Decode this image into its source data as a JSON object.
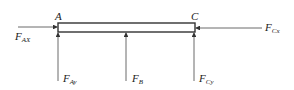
{
  "diagram": {
    "points": [
      {
        "id": "A",
        "label": "A"
      },
      {
        "id": "C",
        "label": "C"
      }
    ],
    "forces": [
      {
        "id": "FAX",
        "symbol": "F",
        "subscript": "AX",
        "direction": "right",
        "at": "A"
      },
      {
        "id": "FAy",
        "symbol": "F",
        "subscript": "Ay",
        "direction": "up",
        "at": "A"
      },
      {
        "id": "FB",
        "symbol": "F",
        "subscript": "B",
        "direction": "up",
        "at": "mid"
      },
      {
        "id": "FCy",
        "symbol": "F",
        "subscript": "Cy",
        "direction": "up",
        "at": "C"
      },
      {
        "id": "FCx",
        "symbol": "F",
        "subscript": "Cx",
        "direction": "left",
        "at": "C"
      }
    ],
    "colors": {
      "line": "#333333",
      "text": "#222222"
    }
  }
}
